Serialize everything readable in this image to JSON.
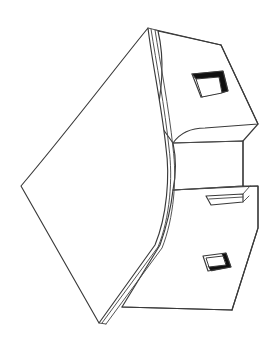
{
  "document": {
    "kind": "line-art-technical-drawing",
    "subject": "bent sheet-metal bracket with curved flange",
    "projection": "isometric",
    "caption": "",
    "background_color": "#ffffff",
    "line_color": "#3a3a3a",
    "accent_dark_color": "#101010",
    "canvas": {
      "width": 270,
      "height": 354
    }
  },
  "features": [
    {
      "id": "curved-flange",
      "label": "Curved front flange",
      "description": "Large curved sheet panel forming the left face",
      "interactable": false
    },
    {
      "id": "upper-top-face",
      "label": "Upper top face",
      "description": "Flat parallelogram face at the top right carrying the large rectangular cutout",
      "interactable": false
    },
    {
      "id": "upper-cutout",
      "label": "Upper rectangular cutout",
      "description": "Large rectangular through-hole with dark chamfer on upper and right inner walls",
      "interactable": false
    },
    {
      "id": "middle-step-face",
      "label": "Middle step face",
      "description": "Recessed step between the upper and lower faces",
      "interactable": false
    },
    {
      "id": "narrow-slot",
      "label": "Narrow horizontal slot",
      "description": "Thin parallelogram slot on the middle step face",
      "interactable": false
    },
    {
      "id": "lower-face",
      "label": "Lower face",
      "description": "Flat parallelogram face at the bottom right carrying the small rectangular recess",
      "interactable": false
    },
    {
      "id": "lower-cutout",
      "label": "Lower rectangular recess",
      "description": "Small rectangular recess with dark chamfer on the right and lower inner walls",
      "interactable": false
    },
    {
      "id": "flange-thickness-edge",
      "label": "Flange thickness edge",
      "description": "Double line showing the material thickness along the curved flange",
      "interactable": false
    }
  ],
  "geometry": {
    "apex_top": [
      148,
      28
    ],
    "left_corner": [
      21,
      186
    ],
    "bottom_tip": [
      99,
      323
    ],
    "right_upper": [
      258,
      124
    ],
    "right_middle": [
      243,
      186
    ],
    "right_lower": [
      258,
      228
    ],
    "right_bottom": [
      232,
      310
    ]
  }
}
